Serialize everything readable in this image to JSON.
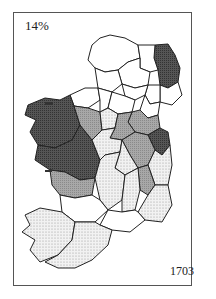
{
  "map": {
    "label_top": "14%",
    "label_bottom": "1703",
    "subject": "Ireland by county, shaded choropleth",
    "legend_shades": {
      "dark": "#4a4a4a",
      "medium": "#9a9a9a",
      "light_dotted": "#dcdcdc",
      "white": "#ffffff"
    }
  }
}
